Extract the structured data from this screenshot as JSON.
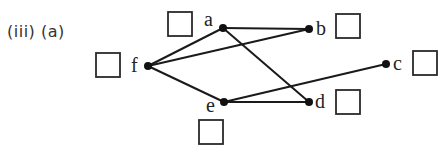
{
  "question": {
    "number": "(iii)",
    "part": "(a)",
    "label": "(iii)  (a)"
  },
  "colors": {
    "edge": "#1a1a1a",
    "node": "#111111",
    "text": "#222222"
  },
  "graph": {
    "vertices": [
      {
        "id": "a",
        "label": "a",
        "x": 223,
        "y": 28,
        "lx": 204,
        "ly": 26,
        "box": {
          "x": 168,
          "y": 12,
          "w": 24,
          "h": 24
        }
      },
      {
        "id": "b",
        "label": "b",
        "x": 309,
        "y": 29,
        "lx": 316,
        "ly": 35,
        "box": {
          "x": 336,
          "y": 14,
          "w": 24,
          "h": 24
        }
      },
      {
        "id": "c",
        "label": "c",
        "x": 386,
        "y": 64,
        "lx": 393,
        "ly": 70,
        "box": {
          "x": 413,
          "y": 51,
          "w": 24,
          "h": 24
        }
      },
      {
        "id": "d",
        "label": "d",
        "x": 309,
        "y": 102,
        "lx": 315,
        "ly": 108,
        "box": {
          "x": 336,
          "y": 90,
          "w": 24,
          "h": 24
        }
      },
      {
        "id": "e",
        "label": "e",
        "x": 224,
        "y": 102,
        "lx": 206,
        "ly": 112,
        "box": {
          "x": 199,
          "y": 120,
          "w": 24,
          "h": 24
        }
      },
      {
        "id": "f",
        "label": "f",
        "x": 148,
        "y": 66,
        "lx": 131,
        "ly": 72,
        "box": {
          "x": 96,
          "y": 53,
          "w": 24,
          "h": 24
        }
      }
    ],
    "edges": [
      [
        "f",
        "a"
      ],
      [
        "f",
        "b"
      ],
      [
        "f",
        "e"
      ],
      [
        "a",
        "b"
      ],
      [
        "a",
        "d"
      ],
      [
        "e",
        "d"
      ],
      [
        "e",
        "c"
      ]
    ]
  }
}
